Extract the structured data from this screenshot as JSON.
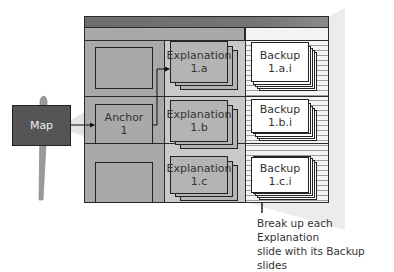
{
  "diagram": {
    "map_label": "Map",
    "anchor": {
      "label": "Anchor\n1"
    },
    "explanations": [
      {
        "label": "Explanation\n1.a"
      },
      {
        "label": "Explanation\n1.b"
      },
      {
        "label": "Explanation\n1.c"
      }
    ],
    "backups": [
      {
        "label": "Backup\n1.a.i"
      },
      {
        "label": "Backup\n1.b.i"
      },
      {
        "label": "Backup\n1.c.i"
      }
    ],
    "annotation": "Break up each Explanation\nslide with its Backup slides",
    "colors": {
      "header": "#707070",
      "map_fill": "#505050",
      "anchor_col": "#a9a9a9",
      "explanation_fill": "#b4b4b4",
      "backup_fill": "#ffffff",
      "outline": "#222222"
    }
  }
}
